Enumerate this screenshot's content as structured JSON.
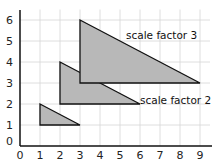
{
  "chart_data": {
    "type": "diagram",
    "title": "",
    "xlabel": "",
    "ylabel": "",
    "xlim": [
      0,
      9.5
    ],
    "ylim": [
      0,
      6.5
    ],
    "x_ticks": [
      "0",
      "1",
      "2",
      "3",
      "4",
      "5",
      "6",
      "7",
      "8",
      "9"
    ],
    "y_ticks": [
      "0",
      "1",
      "2",
      "3",
      "4",
      "5",
      "6"
    ],
    "grid": true,
    "shapes": [
      {
        "name": "original",
        "label": "",
        "vertices": [
          [
            1,
            2
          ],
          [
            1,
            1
          ],
          [
            3,
            1
          ]
        ]
      },
      {
        "name": "scale-factor-2",
        "label": "scale factor 2",
        "vertices": [
          [
            2,
            4
          ],
          [
            2,
            2
          ],
          [
            6,
            2
          ]
        ]
      },
      {
        "name": "scale-factor-3",
        "label": "scale factor 3",
        "vertices": [
          [
            3,
            6
          ],
          [
            3,
            3
          ],
          [
            9,
            3
          ]
        ]
      }
    ],
    "labels": [
      {
        "text": "scale factor 3",
        "x": 5.4,
        "y": 5.3
      },
      {
        "text": "scale factor 2",
        "x": 6.1,
        "y": 2.2
      }
    ]
  },
  "colors": {
    "fill": "#b8b8b8",
    "stroke": "#111111",
    "grid": "#d6d6d6",
    "axis": "#111111"
  }
}
